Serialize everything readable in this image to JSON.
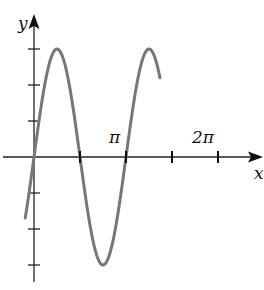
{
  "chart_data": {
    "type": "line",
    "title": "",
    "function": "y = 3 sin(2x)",
    "xlabel": "x",
    "ylabel": "y",
    "x_tick_labels": [
      {
        "value": 3.14159,
        "label": "π"
      },
      {
        "value": 6.28318,
        "label": "2π"
      }
    ],
    "x_ticks": [
      0,
      1.5708,
      3.1416,
      4.7124,
      6.2832
    ],
    "y_ticks": [
      -3,
      -2,
      -1,
      1,
      2,
      3
    ],
    "xlim": [
      -0.7,
      7.5
    ],
    "ylim": [
      -3.5,
      3.9
    ],
    "grid": false,
    "series": [
      {
        "name": "curve",
        "x_range": [
          -0.3,
          4.3
        ],
        "amplitude": 3,
        "period": 3.14159,
        "color": "#777777"
      }
    ]
  },
  "labels": {
    "y_axis": "y",
    "x_axis": "x",
    "pi": "π",
    "two_pi": "2π"
  }
}
